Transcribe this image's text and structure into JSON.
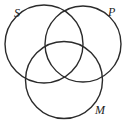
{
  "diagram": {
    "type": "venn",
    "sets": [
      {
        "label": "S",
        "cx": 44,
        "cy": 44,
        "r": 39,
        "label_x": 14,
        "label_y": 17
      },
      {
        "label": "P",
        "cx": 83,
        "cy": 44,
        "r": 38,
        "label_x": 108,
        "label_y": 16
      },
      {
        "label": "M",
        "cx": 64,
        "cy": 80,
        "r": 38.5,
        "label_x": 95,
        "label_y": 114
      }
    ],
    "stroke_color": "#2b2b2b",
    "background": "#ffffff"
  }
}
